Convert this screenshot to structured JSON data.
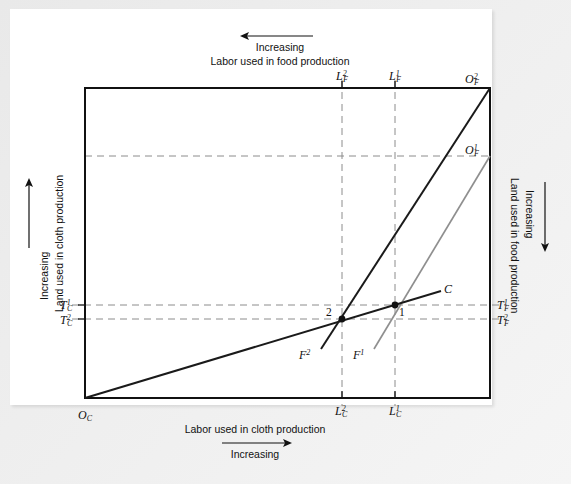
{
  "figure": {
    "type": "diagram",
    "colors": {
      "line_dark": "#1a1a1a",
      "line_light": "#8c8c8c",
      "dashed": "#8c8c8c",
      "frame": "#e9e9e9",
      "page": "#ffffff",
      "text": "#111111"
    }
  },
  "captions": {
    "top": {
      "arrow": "left-arrow",
      "line1": "Increasing",
      "line2": "Labor used in food production"
    },
    "bottom": {
      "line1": "Labor used in cloth production",
      "arrow": "right-arrow",
      "line2": "Increasing"
    },
    "left": {
      "arrow": "up-arrow",
      "line1": "Increasing",
      "line2": "Land used in cloth production"
    },
    "right": {
      "arrow": "down-arrow",
      "line1": "Increasing",
      "line2": "Land used in food production"
    }
  },
  "origins": [
    {
      "key": "O_C",
      "base": "O",
      "sub": "C",
      "sup": "",
      "x": 78,
      "y": 408,
      "note": "cloth origin, bottom-left corner"
    },
    {
      "key": "O_F_2",
      "base": "O",
      "sub": "F",
      "sup": "2",
      "x": 465,
      "y": 72,
      "note": "food origin 2, top-right corner"
    },
    {
      "key": "O_F_1",
      "base": "O",
      "sub": "F",
      "sup": "1",
      "x": 465,
      "y": 143,
      "note": "food origin 1, on right edge"
    }
  ],
  "top_axis_ticks": [
    {
      "key": "L_F_2",
      "base": "L",
      "sub": "F",
      "sup": "2",
      "x": 336,
      "y": 69
    },
    {
      "key": "L_F_1",
      "base": "L",
      "sub": "F",
      "sup": "1",
      "x": 389,
      "y": 69
    }
  ],
  "bottom_axis_ticks": [
    {
      "key": "L_C_2",
      "base": "L",
      "sub": "C",
      "sup": "2",
      "x": 335,
      "y": 404
    },
    {
      "key": "L_C_1",
      "base": "L",
      "sub": "C",
      "sup": "1",
      "x": 389,
      "y": 404
    }
  ],
  "left_axis_ticks": [
    {
      "key": "T_C_1",
      "base": "T",
      "sub": "C",
      "sup": "1",
      "x": 60,
      "y": 298
    },
    {
      "key": "T_C_2",
      "base": "T",
      "sub": "C",
      "sup": "2",
      "x": 60,
      "y": 313
    }
  ],
  "right_axis_ticks": [
    {
      "key": "T_F_1",
      "base": "T",
      "sub": "F",
      "sup": "1",
      "x": 497,
      "y": 298
    },
    {
      "key": "T_F_2",
      "base": "T",
      "sub": "F",
      "sup": "2",
      "x": 497,
      "y": 313
    }
  ],
  "curve_labels": [
    {
      "key": "C",
      "base": "C",
      "sub": "",
      "sup": "",
      "x": 444,
      "y": 282
    },
    {
      "key": "F_2",
      "base": "F",
      "sub": "",
      "sup": "2",
      "x": 299,
      "y": 348
    },
    {
      "key": "F_1",
      "base": "F",
      "sub": "",
      "sup": "1",
      "x": 353,
      "y": 348
    }
  ],
  "point_labels": [
    {
      "key": "point-2",
      "text": "2",
      "x": 326,
      "y": 306
    },
    {
      "key": "point-1",
      "text": "1",
      "x": 399,
      "y": 306
    }
  ],
  "geometry": {
    "box": {
      "left": 85,
      "top": 88,
      "right": 490,
      "bottom": 398
    },
    "points": [
      {
        "name": "equilibrium-2",
        "x": 342,
        "y": 319
      },
      {
        "name": "equilibrium-1",
        "x": 395,
        "y": 305
      }
    ],
    "lines": [
      {
        "name": "C-expansion-path",
        "from": [
          85,
          398
        ],
        "to": [
          440,
          291
        ],
        "style": "solid-dark"
      },
      {
        "name": "F2-expansion-path",
        "from": [
          490,
          88
        ],
        "to": [
          322,
          348
        ],
        "style": "solid-dark"
      },
      {
        "name": "F1-expansion-path",
        "from": [
          490,
          156
        ],
        "to": [
          375,
          348
        ],
        "style": "solid-light"
      }
    ],
    "dashed": {
      "vertical_x": [
        342,
        395
      ],
      "horizontal_y": [
        156,
        305,
        319
      ]
    }
  }
}
